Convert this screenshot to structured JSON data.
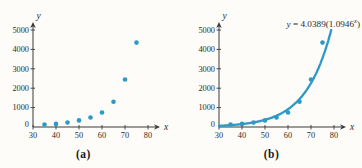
{
  "equation": {
    "lhs": "y",
    "rel": " = ",
    "coef": "4.0389(1.0946",
    "sup": "x",
    "close": ")"
  },
  "chart_data": [
    {
      "type": "scatter",
      "caption": "(a)",
      "xlabel": "x",
      "ylabel": "y",
      "xlim": [
        30,
        80
      ],
      "ylim": [
        0,
        5000
      ],
      "xticks": [
        30,
        40,
        50,
        60,
        70,
        80
      ],
      "yticks": [
        0,
        1000,
        2000,
        3000,
        4000,
        5000
      ],
      "grid": false,
      "x": [
        35,
        40,
        45,
        50,
        55,
        60,
        65,
        70,
        75
      ],
      "y": [
        130,
        160,
        230,
        340,
        490,
        750,
        1300,
        2450,
        4350
      ],
      "point_color": "#2D9AC6",
      "axis_color": "#3a3a3a"
    },
    {
      "type": "scatter",
      "caption": "(b)",
      "xlabel": "x",
      "ylabel": "y",
      "xlim": [
        30,
        80
      ],
      "ylim": [
        0,
        5000
      ],
      "xticks": [
        30,
        40,
        50,
        60,
        70,
        80
      ],
      "yticks": [
        0,
        1000,
        2000,
        3000,
        4000,
        5000
      ],
      "grid": false,
      "x": [
        35,
        40,
        45,
        50,
        55,
        60,
        65,
        70,
        75
      ],
      "y": [
        130,
        160,
        230,
        340,
        490,
        750,
        1300,
        2450,
        4350
      ],
      "point_color": "#2D9AC6",
      "axis_color": "#3a3a3a",
      "curve": {
        "model": "exponential",
        "equation_text": "y = 4.0389(1.0946^x)",
        "a": 4.0389,
        "b": 1.0946,
        "x_start": 30,
        "x_end": 79,
        "color": "#2D9AC6"
      }
    }
  ]
}
